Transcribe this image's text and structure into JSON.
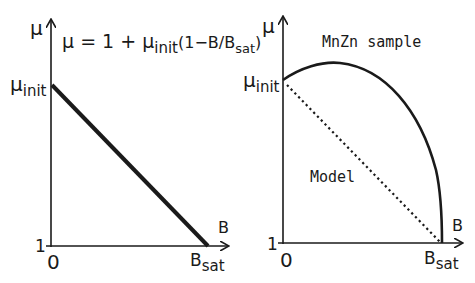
{
  "left_panel": {
    "y_axis_label": "μ",
    "x_axis_label": "B",
    "formula": {
      "prefix": "μ = 1 + μ",
      "prefix_sub": "init",
      "middle": "(1−B/B",
      "middle_sub": "sat",
      "suffix": ")"
    },
    "y_tick_top": "μ",
    "y_tick_top_sub": "init",
    "y_tick_bottom": "1",
    "x_tick_origin": "0",
    "x_tick_end": "B",
    "x_tick_end_sub": "sat",
    "line_style": "solid-thick"
  },
  "right_panel": {
    "y_axis_label": "μ",
    "x_axis_label": "B",
    "sample_label": "MnZn sample",
    "model_label": "Model",
    "y_tick_top": "μ",
    "y_tick_top_sub": "init",
    "y_tick_bottom": "1",
    "x_tick_origin": "0",
    "x_tick_end": "B",
    "x_tick_end_sub": "sat",
    "sample_curve_style": "solid",
    "model_line_style": "dotted"
  },
  "colors": {
    "ink": "#1a1a1a",
    "background": "#ffffff"
  }
}
